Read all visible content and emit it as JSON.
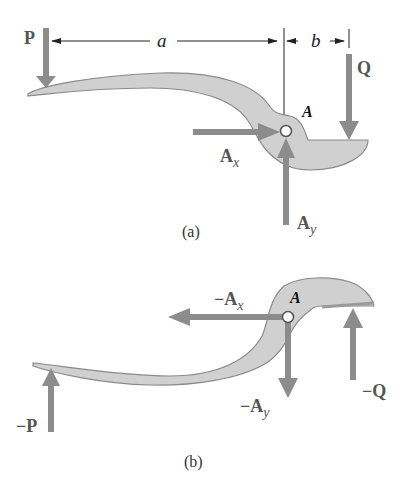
{
  "figure": {
    "part_a": {
      "caption": "(a)",
      "dimensions": {
        "a": "a",
        "b": "b"
      },
      "forces": {
        "P": "P",
        "Q": "Q",
        "Ax": "A",
        "Ax_sub": "x",
        "Ay": "A",
        "Ay_sub": "y"
      },
      "pin_label": "A"
    },
    "part_b": {
      "caption": "(b)",
      "forces": {
        "negP": "−P",
        "negQ": "−Q",
        "negAx": "−A",
        "negAx_sub": "x",
        "negAy": "−A",
        "negAy_sub": "y"
      },
      "pin_label": "A"
    },
    "colors": {
      "member_fill": "#d0d0d0",
      "member_stroke": "#8a8a8a",
      "force_arrow": "#8c8c8c",
      "dimension_line": "#222222"
    }
  }
}
